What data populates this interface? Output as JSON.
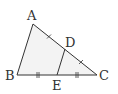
{
  "diagram": {
    "type": "triangle",
    "points": {
      "A": {
        "x": 33,
        "y": 24
      },
      "B": {
        "x": 17,
        "y": 75
      },
      "C": {
        "x": 97,
        "y": 75
      },
      "D": {
        "x": 65,
        "y": 49
      },
      "E": {
        "x": 57,
        "y": 75
      }
    },
    "labels": {
      "A": "A",
      "B": "B",
      "C": "C",
      "D": "D",
      "E": "E"
    },
    "segments": [
      "AB",
      "BC",
      "CA",
      "DE"
    ],
    "equal_marks": {
      "single_tick": [
        "AD",
        "DC"
      ],
      "double_tick": [
        "BE",
        "EC"
      ]
    },
    "fill_color": "#f3f3f3",
    "stroke_color": "#333333"
  }
}
